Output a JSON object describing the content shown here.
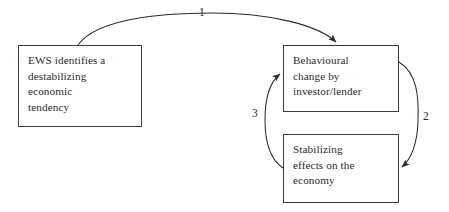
{
  "diagram": {
    "stroke_color": "#3b3b44",
    "text_color": "#2a2a33",
    "background_color": "#ffffff",
    "nodes": [
      {
        "id": "ews",
        "name": "EWS identifies a destabilizing economic tendency",
        "lines": [
          "EWS identifies a",
          "destabilizing",
          "economic",
          "tendency"
        ]
      },
      {
        "id": "behaviour",
        "name": "Behavioural change by investor/lender",
        "lines": [
          "Behavioural",
          "change by",
          "investor/lender"
        ]
      },
      {
        "id": "stabilizing",
        "name": "Stabilizing effects on the economy",
        "lines": [
          "Stabilizing",
          "effects on the",
          "economy"
        ]
      }
    ],
    "edges": [
      {
        "id": "edge1",
        "label": "1",
        "from": "ews",
        "to": "behaviour",
        "shape": "curved-arc-over-top",
        "arrowhead": "at-target"
      },
      {
        "id": "edge2",
        "label": "2",
        "from": "behaviour",
        "to": "stabilizing",
        "shape": "curved-arc-right-side",
        "arrowhead": "at-target"
      },
      {
        "id": "edge3",
        "label": "3",
        "from": "stabilizing",
        "to": "behaviour",
        "shape": "curved-arc-left-side",
        "arrowhead": "at-target"
      }
    ]
  }
}
